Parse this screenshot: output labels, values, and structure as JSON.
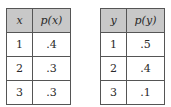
{
  "tables": [
    {
      "headers": [
        "x",
        "p(x)"
      ],
      "rows": [
        [
          "1",
          ".4"
        ],
        [
          "2",
          ".3"
        ],
        [
          "3",
          ".3"
        ]
      ]
    },
    {
      "headers": [
        "y",
        "p(y)"
      ],
      "rows": [
        [
          "1",
          ".5"
        ],
        [
          "2",
          ".4"
        ],
        [
          "3",
          ".1"
        ]
      ]
    }
  ],
  "colors": {
    "header_fill": "#c8c8c8",
    "border": "#555555"
  }
}
